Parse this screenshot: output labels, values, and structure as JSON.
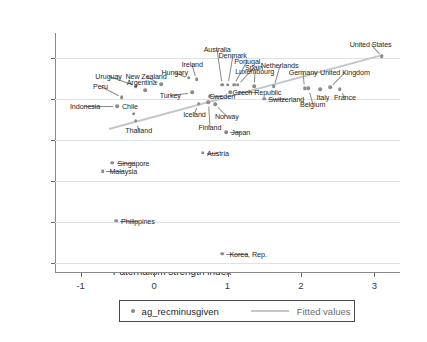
{
  "chart_data": {
    "type": "scatter",
    "title": "",
    "xlabel": "Paternalism strength index",
    "ylabel": "Percentage of concessions received minus those given",
    "xlim": [
      -1.35,
      3.35
    ],
    "ylim": [
      -42.5,
      16.0
    ],
    "xticks": [
      -1,
      0,
      1,
      2,
      3
    ],
    "xtick_labels": [
      "-1",
      "0",
      "1",
      "2",
      "3"
    ],
    "yticks": [
      10,
      0,
      -10,
      -20,
      -30,
      -40
    ],
    "ytick_labels": [
      "10",
      "0",
      "-10",
      "-20",
      "-30",
      "-40"
    ],
    "grid": "horizontal",
    "legend_position": "below-axis",
    "series_name": "ag_recminusgiven",
    "fit_name": "Fitted values",
    "marker_color": "#8c8c8c",
    "fit_color": "#c3c7c9",
    "fit_line": {
      "x0": -0.62,
      "y0": -7.1,
      "x1": 3.12,
      "y1": 11.0
    },
    "points": [
      {
        "label": "Indonesia",
        "x": -0.5,
        "y": -1.9,
        "lx": -0.94,
        "ly": -1.9
      },
      {
        "label": "Peru",
        "x": -0.44,
        "y": 0.3,
        "lx": -0.73,
        "ly": 3.0
      },
      {
        "label": "Uruguay",
        "x": -0.25,
        "y": 3.1,
        "lx": -0.62,
        "ly": 5.4
      },
      {
        "label": "Chile",
        "x": -0.28,
        "y": -3.7,
        "lx": -0.33,
        "ly": -1.9
      },
      {
        "label": "Thailand",
        "x": -0.25,
        "y": -5.4,
        "lx": -0.21,
        "ly": -7.6
      },
      {
        "label": "Argentina",
        "x": -0.12,
        "y": 2.1,
        "lx": -0.17,
        "ly": 4.0
      },
      {
        "label": "New Zealand",
        "x": 0.1,
        "y": 3.5,
        "lx": -0.11,
        "ly": 5.4
      },
      {
        "label": "Hungary",
        "x": 0.47,
        "y": 5.1,
        "lx": 0.28,
        "ly": 6.6
      },
      {
        "label": "Turkey",
        "x": 0.52,
        "y": 1.6,
        "lx": 0.22,
        "ly": 1.0
      },
      {
        "label": "Ireland",
        "x": 0.58,
        "y": 4.7,
        "lx": 0.52,
        "ly": 8.4
      },
      {
        "label": "Iceland",
        "x": 0.61,
        "y": -1.2,
        "lx": 0.55,
        "ly": -3.7
      },
      {
        "label": "Sweden",
        "x": 0.76,
        "y": 0.6,
        "lx": 0.93,
        "ly": 0.6
      },
      {
        "label": "Finland",
        "x": 0.74,
        "y": -0.8,
        "lx": 0.76,
        "ly": -6.9
      },
      {
        "label": "Norway",
        "x": 0.83,
        "y": -1.3,
        "lx": 0.99,
        "ly": -4.2
      },
      {
        "label": "Australia",
        "x": 0.93,
        "y": 3.4,
        "lx": 0.86,
        "ly": 12.0
      },
      {
        "label": "Denmark",
        "x": 1.0,
        "y": 3.4,
        "lx": 1.07,
        "ly": 10.7
      },
      {
        "label": "Portugal",
        "x": 1.09,
        "y": 3.4,
        "lx": 1.27,
        "ly": 9.2
      },
      {
        "label": "Spain",
        "x": 1.14,
        "y": 3.4,
        "lx": 1.36,
        "ly": 7.7
      },
      {
        "label": "Czech Republic",
        "x": 1.04,
        "y": 1.6,
        "lx": 1.4,
        "ly": 1.6
      },
      {
        "label": "Luxembourg",
        "x": 1.36,
        "y": 3.0,
        "lx": 1.37,
        "ly": 6.7
      },
      {
        "label": "Netherlands",
        "x": 1.63,
        "y": 3.0,
        "lx": 1.71,
        "ly": 8.1
      },
      {
        "label": "Switzerland",
        "x": 1.5,
        "y": 0.0,
        "lx": 1.8,
        "ly": 0.0
      },
      {
        "label": "Germany",
        "x": 2.05,
        "y": 2.6,
        "lx": 2.03,
        "ly": 6.4
      },
      {
        "label": "Belgium",
        "x": 2.1,
        "y": 2.5,
        "lx": 2.16,
        "ly": -1.2
      },
      {
        "label": "Italy",
        "x": 2.26,
        "y": 2.3,
        "lx": 2.3,
        "ly": 0.4
      },
      {
        "label": "United Kingdom",
        "x": 2.4,
        "y": 2.8,
        "lx": 2.6,
        "ly": 6.4
      },
      {
        "label": "France",
        "x": 2.53,
        "y": 2.3,
        "lx": 2.6,
        "ly": 0.4
      },
      {
        "label": "United States",
        "x": 3.1,
        "y": 10.3,
        "lx": 2.95,
        "ly": 13.3
      },
      {
        "label": "Japan",
        "x": 0.98,
        "y": -8.2,
        "lx": 1.18,
        "ly": -8.2
      },
      {
        "label": "Austria",
        "x": 0.66,
        "y": -13.2,
        "lx": 0.87,
        "ly": -13.2
      },
      {
        "label": "Singapore",
        "x": -0.57,
        "y": -15.6,
        "lx": -0.28,
        "ly": -15.6
      },
      {
        "label": "Malaysia",
        "x": -0.7,
        "y": -17.7,
        "lx": -0.42,
        "ly": -17.7
      },
      {
        "label": "Philippines",
        "x": -0.52,
        "y": -29.8,
        "lx": -0.22,
        "ly": -29.8
      },
      {
        "label": "Korea, Rep.",
        "x": 0.93,
        "y": -37.8,
        "lx": 1.28,
        "ly": -37.8
      }
    ]
  },
  "legend": {
    "series_label": "ag_recminusgiven",
    "fit_label": "Fitted values"
  }
}
